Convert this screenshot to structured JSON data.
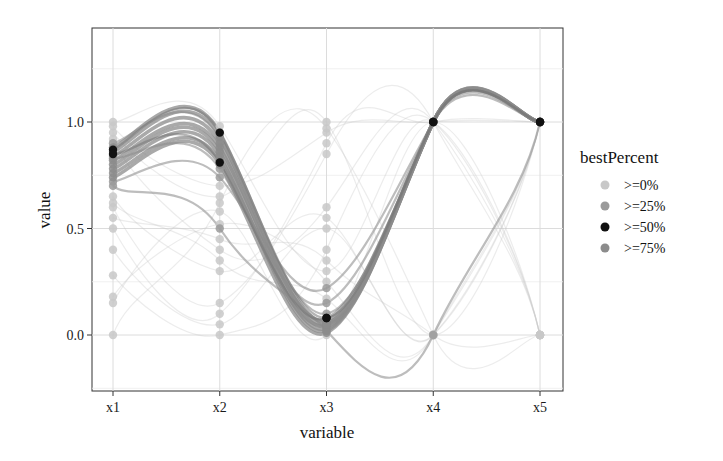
{
  "chart_data": {
    "type": "line",
    "subtype": "parallel-coordinates-spline",
    "title": "",
    "xlabel": "variable",
    "ylabel": "value",
    "categories": [
      "x1",
      "x2",
      "x3",
      "x4",
      "x5"
    ],
    "yticks": [
      "0.0",
      "0.5",
      "1.0"
    ],
    "ytick_values": [
      0.0,
      0.5,
      1.0
    ],
    "ylim": [
      -0.25,
      1.38
    ],
    "grid": true,
    "legend": {
      "title": "bestPercent",
      "placement": "right",
      "entries": [
        {
          "label": ">=0%",
          "color": "#c8c8c8"
        },
        {
          "label": ">=25%",
          "color": "#9a9a9a"
        },
        {
          "label": ">=50%",
          "color": "#111111"
        },
        {
          "label": ">=75%",
          "color": "#8c8c8c"
        }
      ]
    },
    "series": [
      {
        "name": ">=75%",
        "values": [
          0.88,
          0.95,
          0.06,
          1.0,
          1.0
        ]
      },
      {
        "name": ">=75%",
        "values": [
          0.86,
          0.93,
          0.05,
          1.0,
          1.0
        ]
      },
      {
        "name": ">=75%",
        "values": [
          0.84,
          0.9,
          0.04,
          1.0,
          1.0
        ]
      },
      {
        "name": ">=75%",
        "values": [
          0.82,
          0.88,
          0.07,
          1.0,
          1.0
        ]
      },
      {
        "name": ">=75%",
        "values": [
          0.8,
          0.86,
          0.03,
          1.0,
          1.0
        ]
      },
      {
        "name": ">=75%",
        "values": [
          0.78,
          0.84,
          0.02,
          1.0,
          1.0
        ]
      },
      {
        "name": ">=75%",
        "values": [
          0.76,
          0.82,
          0.05,
          1.0,
          1.0
        ]
      },
      {
        "name": ">=75%",
        "values": [
          0.74,
          0.8,
          0.01,
          1.0,
          1.0
        ]
      },
      {
        "name": ">=50%",
        "values": [
          0.87,
          0.95,
          0.08,
          1.0,
          1.0
        ]
      },
      {
        "name": ">=50%",
        "values": [
          0.85,
          0.81,
          0.08,
          1.0,
          1.0
        ]
      },
      {
        "name": ">=25%",
        "values": [
          0.9,
          0.92,
          0.1,
          1.0,
          1.0
        ]
      },
      {
        "name": ">=25%",
        "values": [
          0.83,
          0.78,
          0.15,
          1.0,
          1.0
        ]
      },
      {
        "name": ">=25%",
        "values": [
          0.72,
          0.74,
          0.22,
          1.0,
          1.0
        ]
      },
      {
        "name": ">=25%",
        "values": [
          0.7,
          0.5,
          0.02,
          0.0,
          1.0
        ]
      },
      {
        "name": ">=0%",
        "values": [
          1.0,
          0.98,
          0.3,
          1.0,
          0.0
        ]
      },
      {
        "name": ">=0%",
        "values": [
          0.98,
          0.7,
          0.95,
          1.0,
          1.0
        ]
      },
      {
        "name": ">=0%",
        "values": [
          0.95,
          0.65,
          1.0,
          0.0,
          1.0
        ]
      },
      {
        "name": ">=0%",
        "values": [
          0.92,
          0.4,
          0.6,
          1.0,
          0.0
        ]
      },
      {
        "name": ">=0%",
        "values": [
          0.65,
          0.3,
          0.55,
          0.0,
          1.0
        ]
      },
      {
        "name": ">=0%",
        "values": [
          0.6,
          0.15,
          0.85,
          1.0,
          0.0
        ]
      },
      {
        "name": ">=0%",
        "values": [
          0.55,
          0.45,
          0.35,
          0.0,
          0.0
        ]
      },
      {
        "name": ">=0%",
        "values": [
          0.5,
          0.1,
          0.9,
          1.0,
          1.0
        ]
      },
      {
        "name": ">=0%",
        "values": [
          0.4,
          0.05,
          0.5,
          0.0,
          1.0
        ]
      },
      {
        "name": ">=0%",
        "values": [
          0.28,
          0.0,
          0.4,
          1.0,
          0.0
        ]
      },
      {
        "name": ">=0%",
        "values": [
          0.18,
          0.52,
          0.25,
          0.0,
          1.0
        ]
      },
      {
        "name": ">=0%",
        "values": [
          0.15,
          0.58,
          0.0,
          1.0,
          0.0
        ]
      },
      {
        "name": ">=0%",
        "values": [
          0.0,
          0.62,
          0.97,
          0.0,
          0.0
        ]
      },
      {
        "name": ">=0%",
        "values": [
          0.62,
          0.35,
          0.17,
          0.0,
          1.0
        ]
      }
    ]
  }
}
